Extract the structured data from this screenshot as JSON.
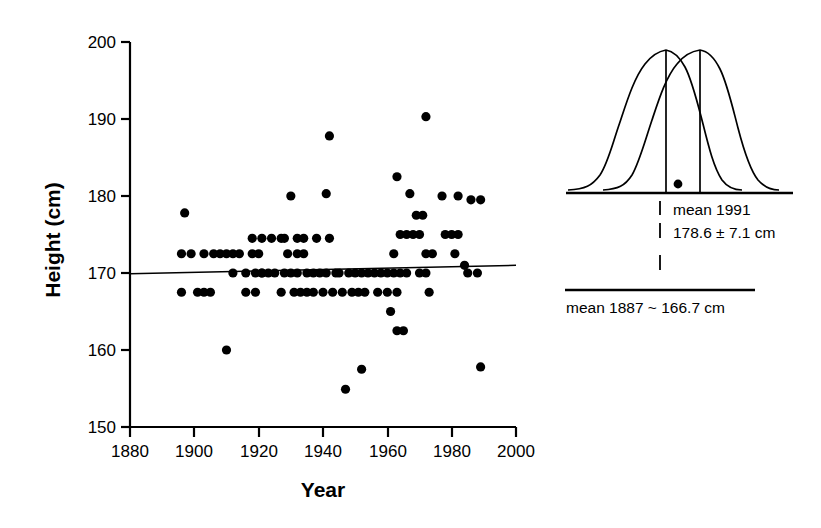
{
  "chart_data": {
    "type": "scatter",
    "title": "",
    "xlabel": "Year",
    "ylabel": "Height (cm)",
    "xlim": [
      1880,
      2000
    ],
    "ylim": [
      150,
      200
    ],
    "xticks": [
      1880,
      1900,
      1920,
      1940,
      1960,
      1980,
      2000
    ],
    "xtick_labels": [
      "1880",
      "1900",
      "1920",
      "1940",
      "1960",
      "1980",
      "2000"
    ],
    "yticks": [
      150,
      160,
      170,
      180,
      190,
      200
    ],
    "ytick_labels": [
      "150",
      "160",
      "170",
      "180",
      "190",
      "200"
    ],
    "grid": false,
    "legend": "none",
    "series": [
      {
        "name": "Presidential height by election year",
        "marker": "filled-circle",
        "color": "#000000",
        "points": [
          [
            1897,
            177.8
          ],
          [
            1896,
            172.5
          ],
          [
            1899,
            172.5
          ],
          [
            1903,
            172.5
          ],
          [
            1906,
            172.5
          ],
          [
            1908,
            172.5
          ],
          [
            1910,
            172.5
          ],
          [
            1912,
            172.5
          ],
          [
            1914,
            172.5
          ],
          [
            1896,
            167.5
          ],
          [
            1901,
            167.5
          ],
          [
            1903,
            167.5
          ],
          [
            1905,
            167.5
          ],
          [
            1910,
            160.0
          ],
          [
            1918,
            172.5
          ],
          [
            1920,
            172.5
          ],
          [
            1919,
            170.0
          ],
          [
            1921,
            170.0
          ],
          [
            1923,
            170.0
          ],
          [
            1925,
            170.0
          ],
          [
            1918,
            174.5
          ],
          [
            1921,
            174.5
          ],
          [
            1924,
            174.5
          ],
          [
            1927,
            174.5
          ],
          [
            1912,
            170.0
          ],
          [
            1916,
            170.0
          ],
          [
            1921,
            170.0
          ],
          [
            1916,
            167.5
          ],
          [
            1919,
            167.5
          ],
          [
            1928,
            174.5
          ],
          [
            1932,
            174.5
          ],
          [
            1934,
            174.5
          ],
          [
            1929,
            172.5
          ],
          [
            1932,
            172.5
          ],
          [
            1934,
            172.5
          ],
          [
            1928,
            170.0
          ],
          [
            1930,
            170.0
          ],
          [
            1932,
            170.0
          ],
          [
            1935,
            170.0
          ],
          [
            1937,
            170.0
          ],
          [
            1927,
            167.5
          ],
          [
            1931,
            167.5
          ],
          [
            1933,
            167.5
          ],
          [
            1935,
            167.5
          ],
          [
            1937,
            167.5
          ],
          [
            1930,
            180.0
          ],
          [
            1938,
            174.5
          ],
          [
            1942,
            174.5
          ],
          [
            1942,
            187.8
          ],
          [
            1941,
            180.3
          ],
          [
            1939,
            170.0
          ],
          [
            1941,
            170.0
          ],
          [
            1944,
            170.0
          ],
          [
            1940,
            167.5
          ],
          [
            1943,
            167.5
          ],
          [
            1947,
            154.9
          ],
          [
            1945,
            170.0
          ],
          [
            1948,
            170.0
          ],
          [
            1950,
            170.0
          ],
          [
            1952,
            170.0
          ],
          [
            1954,
            170.0
          ],
          [
            1946,
            167.5
          ],
          [
            1949,
            167.5
          ],
          [
            1951,
            167.5
          ],
          [
            1953,
            167.5
          ],
          [
            1952,
            157.5
          ],
          [
            1956,
            170.0
          ],
          [
            1958,
            170.0
          ],
          [
            1960,
            170.0
          ],
          [
            1962,
            170.0
          ],
          [
            1964,
            170.0
          ],
          [
            1966,
            170.0
          ],
          [
            1957,
            167.5
          ],
          [
            1960,
            167.5
          ],
          [
            1963,
            167.5
          ],
          [
            1962,
            172.5
          ],
          [
            1964,
            175.0
          ],
          [
            1961,
            165.0
          ],
          [
            1963,
            162.5
          ],
          [
            1965,
            162.5
          ],
          [
            1963,
            182.5
          ],
          [
            1966,
            175.0
          ],
          [
            1968,
            175.0
          ],
          [
            1970,
            175.0
          ],
          [
            1967,
            180.3
          ],
          [
            1969,
            177.5
          ],
          [
            1971,
            177.5
          ],
          [
            1972,
            190.3
          ],
          [
            1972,
            172.5
          ],
          [
            1974,
            172.5
          ],
          [
            1970,
            170.0
          ],
          [
            1972,
            170.0
          ],
          [
            1973,
            167.5
          ],
          [
            1977,
            180.0
          ],
          [
            1982,
            180.0
          ],
          [
            1978,
            175.0
          ],
          [
            1980,
            175.0
          ],
          [
            1982,
            175.0
          ],
          [
            1981,
            172.5
          ],
          [
            1984,
            171.0
          ],
          [
            1985,
            170.0
          ],
          [
            1988,
            170.0
          ],
          [
            1989,
            179.5
          ],
          [
            1986,
            179.5
          ],
          [
            1989,
            157.8
          ]
        ]
      }
    ],
    "trendline": {
      "name": "linear regression",
      "x_start": 1880,
      "y_start": 169.9,
      "x_end": 2000,
      "y_end": 171.0,
      "color": "#000000"
    }
  },
  "inset": {
    "name": "distribution-comparison",
    "curves": [
      {
        "name": "curve-1887",
        "label": "1887 distribution",
        "mean_label": "mean 1887"
      },
      {
        "name": "curve-1991",
        "label": "1991 distribution",
        "mean_label": "mean 1991"
      }
    ],
    "labels": {
      "mean_1991_line1": "mean 1991",
      "mean_1991_line2": "178.6 ± 7.1 cm",
      "mean_1887": "mean 1887 ~ 166.7 cm"
    },
    "tick_marks": [
      "|",
      "|",
      "|"
    ]
  },
  "colors": {
    "ink": "#000000",
    "background": "#ffffff"
  }
}
